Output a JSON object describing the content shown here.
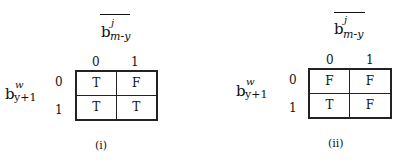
{
  "diagrams": [
    {
      "caption": "(i)",
      "column_variable": {
        "base": "b",
        "superscript": "j",
        "subscript": "m-y",
        "overlined": true
      },
      "row_variable": {
        "base": "b",
        "superscript": "w",
        "subscript": "y+1"
      },
      "column_headers": [
        "0",
        "1"
      ],
      "row_headers": [
        "0",
        "1"
      ],
      "cells": [
        [
          "T",
          "F"
        ],
        [
          "T",
          "T"
        ]
      ]
    },
    {
      "caption": "(ii)",
      "column_variable": {
        "base": "b",
        "superscript": "j",
        "subscript": "m-y",
        "overlined": true
      },
      "row_variable": {
        "base": "b",
        "superscript": "w",
        "subscript": "y+1"
      },
      "column_headers": [
        "0",
        "1"
      ],
      "row_headers": [
        "0",
        "1"
      ],
      "cells": [
        [
          "F",
          "F"
        ],
        [
          "T",
          "F"
        ]
      ]
    }
  ]
}
